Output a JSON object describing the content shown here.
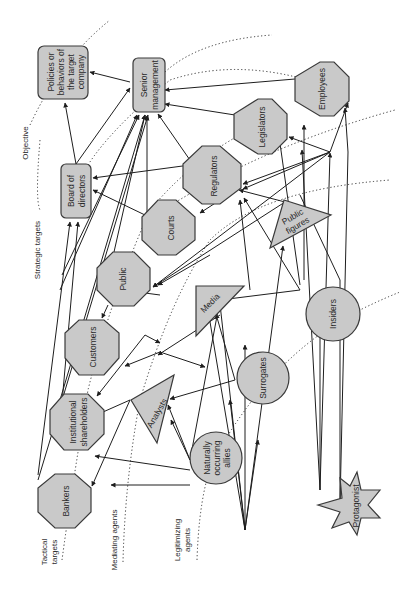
{
  "diagram": {
    "rings": [
      {
        "id": "objective",
        "label": "Objective"
      },
      {
        "id": "strategic",
        "label": "Strategic targets"
      },
      {
        "id": "tactical",
        "label": "Tactical targets"
      },
      {
        "id": "mediating",
        "label": "Mediating agents"
      },
      {
        "id": "legitimizing",
        "label": "Legitimizing agents"
      }
    ],
    "ring_lines": {
      "tactical_1": "Tactical",
      "tactical_2": "targets",
      "legitimizing_1": "Legitimizing",
      "legitimizing_2": "agents"
    },
    "nodes": {
      "policies": {
        "lines": [
          "Policies or",
          "behaviors of",
          "the target",
          "company"
        ],
        "shape": "rounded-rect"
      },
      "senior_management": {
        "lines": [
          "Senior",
          "management"
        ],
        "shape": "rounded-rect"
      },
      "board": {
        "lines": [
          "Board of",
          "directors"
        ],
        "shape": "rounded-rect"
      },
      "employees": {
        "label": "Employees",
        "shape": "octagon"
      },
      "legislators": {
        "label": "Legislators",
        "shape": "octagon"
      },
      "regulators": {
        "label": "Regulators",
        "shape": "octagon"
      },
      "courts": {
        "label": "Courts",
        "shape": "octagon"
      },
      "public": {
        "label": "Public",
        "shape": "octagon"
      },
      "customers": {
        "label": "Customers",
        "shape": "octagon"
      },
      "institutional": {
        "lines": [
          "Institutional",
          "shareholders"
        ],
        "shape": "octagon"
      },
      "bankers": {
        "label": "Bankers",
        "shape": "octagon"
      },
      "public_figures": {
        "lines": [
          "Public",
          "figures"
        ],
        "shape": "triangle"
      },
      "media": {
        "label": "Media",
        "shape": "triangle"
      },
      "analysts": {
        "label": "Analysts",
        "shape": "triangle"
      },
      "insiders": {
        "label": "Insiders",
        "shape": "circle"
      },
      "surrogates": {
        "label": "Surrogates",
        "shape": "circle"
      },
      "allies": {
        "lines": [
          "Naturally",
          "occurring",
          "allies"
        ],
        "shape": "circle"
      },
      "protagonist": {
        "label": "Protagonist",
        "shape": "star"
      }
    },
    "colors": {
      "node_fill": "#c9c9c9",
      "stroke": "#3a3a3a",
      "background": "#ffffff"
    }
  }
}
